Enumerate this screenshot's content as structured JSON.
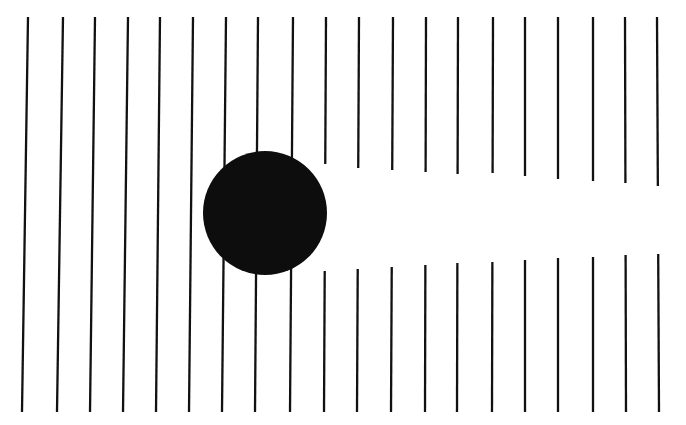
{
  "figure": {
    "canvas": {
      "width": 686,
      "height": 425
    },
    "colors": {
      "background": "#ffffff",
      "ink": "#111111",
      "disk": "#0d0d0d"
    },
    "stroke": {
      "width": 2.3,
      "linecap": "butt",
      "count": 20,
      "top_y": 17,
      "bottom_y": 412,
      "slant_px": -6
    },
    "disk": {
      "shape": "circle",
      "center_x": 265,
      "center_y": 213,
      "radius": 62,
      "fill": "#0d0d0d"
    },
    "gap": {
      "shape": "illusory-bar",
      "label": "interrupted-line band",
      "start_x": 320,
      "end_x": 686,
      "left_half_height": 54,
      "right_half_height": 36
    },
    "lines": [
      {
        "id": "line-01",
        "x_top": 28,
        "x_bottom": 22,
        "occluded": false,
        "gap_top_y": null,
        "gap_bottom_y": null
      },
      {
        "id": "line-02",
        "x_top": 63,
        "x_bottom": 57,
        "occluded": false,
        "gap_top_y": null,
        "gap_bottom_y": null
      },
      {
        "id": "line-03",
        "x_top": 95,
        "x_bottom": 90,
        "occluded": false,
        "gap_top_y": null,
        "gap_bottom_y": null
      },
      {
        "id": "line-04",
        "x_top": 128,
        "x_bottom": 123,
        "occluded": false,
        "gap_top_y": null,
        "gap_bottom_y": null
      },
      {
        "id": "line-05",
        "x_top": 160,
        "x_bottom": 156,
        "occluded": false,
        "gap_top_y": null,
        "gap_bottom_y": null
      },
      {
        "id": "line-06",
        "x_top": 193,
        "x_bottom": 189,
        "occluded": false,
        "gap_top_y": null,
        "gap_bottom_y": null
      },
      {
        "id": "line-07",
        "x_top": 226,
        "x_bottom": 222,
        "occluded": false,
        "gap_top_y": null,
        "gap_bottom_y": null
      },
      {
        "id": "line-08",
        "x_top": 258,
        "x_bottom": 255,
        "occluded": false,
        "gap_top_y": null,
        "gap_bottom_y": null
      },
      {
        "id": "line-09",
        "x_top": 293,
        "x_bottom": 290,
        "occluded": false,
        "gap_top_y": null,
        "gap_bottom_y": null
      },
      {
        "id": "line-10",
        "x_top": 326,
        "x_bottom": 324,
        "occluded": true,
        "gap_top_y": 164,
        "gap_bottom_y": 271
      },
      {
        "id": "line-11",
        "x_top": 359,
        "x_bottom": 357,
        "occluded": true,
        "gap_top_y": 168,
        "gap_bottom_y": 269
      },
      {
        "id": "line-12",
        "x_top": 393,
        "x_bottom": 391,
        "occluded": true,
        "gap_top_y": 170,
        "gap_bottom_y": 267
      },
      {
        "id": "line-13",
        "x_top": 426,
        "x_bottom": 425,
        "occluded": true,
        "gap_top_y": 172,
        "gap_bottom_y": 265
      },
      {
        "id": "line-14",
        "x_top": 458,
        "x_bottom": 457,
        "occluded": true,
        "gap_top_y": 174,
        "gap_bottom_y": 263
      },
      {
        "id": "line-15",
        "x_top": 493,
        "x_bottom": 492,
        "occluded": true,
        "gap_top_y": 173,
        "gap_bottom_y": 262
      },
      {
        "id": "line-16",
        "x_top": 525,
        "x_bottom": 525,
        "occluded": true,
        "gap_top_y": 176,
        "gap_bottom_y": 260
      },
      {
        "id": "line-17",
        "x_top": 558,
        "x_bottom": 558,
        "occluded": true,
        "gap_top_y": 179,
        "gap_bottom_y": 258
      },
      {
        "id": "line-18",
        "x_top": 593,
        "x_bottom": 593,
        "occluded": true,
        "gap_top_y": 181,
        "gap_bottom_y": 257
      },
      {
        "id": "line-19",
        "x_top": 625,
        "x_bottom": 626,
        "occluded": true,
        "gap_top_y": 183,
        "gap_bottom_y": 255
      },
      {
        "id": "line-20",
        "x_top": 657,
        "x_bottom": 659,
        "occluded": true,
        "gap_top_y": 186,
        "gap_bottom_y": 254
      }
    ]
  }
}
